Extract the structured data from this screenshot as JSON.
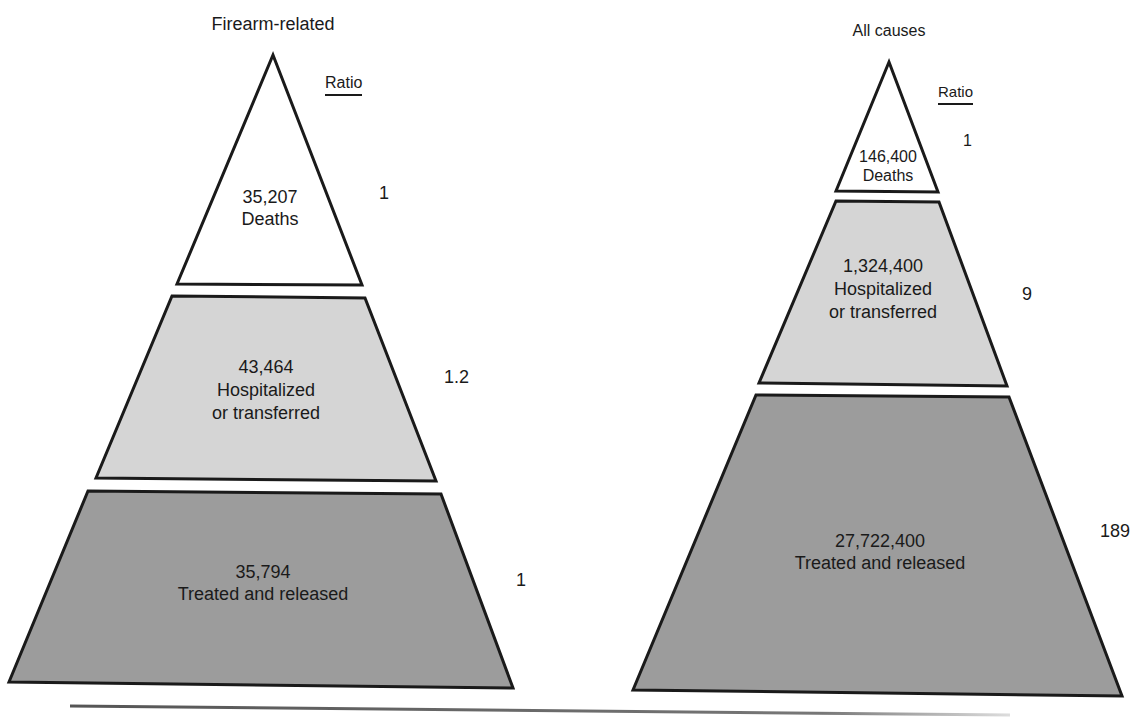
{
  "colors": {
    "deaths_fill": "#ffffff",
    "hospitalized_fill": "#d5d5d5",
    "treated_fill": "#9c9c9c",
    "stroke": "#1a1a1a"
  },
  "pyramids": [
    {
      "title": "Firearm-related",
      "ratio_header": "Ratio",
      "tiers": [
        {
          "value": "35,207",
          "label": "Deaths",
          "ratio": "1"
        },
        {
          "value": "43,464",
          "label_line1": "Hospitalized",
          "label_line2": "or transferred",
          "ratio": "1.2"
        },
        {
          "value": "35,794",
          "label": "Treated and released",
          "ratio": "1"
        }
      ]
    },
    {
      "title": "All causes",
      "ratio_header": "Ratio",
      "tiers": [
        {
          "value": "146,400",
          "label": "Deaths",
          "ratio": "1"
        },
        {
          "value": "1,324,400",
          "label_line1": "Hospitalized",
          "label_line2": "or transferred",
          "ratio": "9"
        },
        {
          "value": "27,722,400",
          "label": "Treated and released",
          "ratio": "189"
        }
      ]
    }
  ]
}
